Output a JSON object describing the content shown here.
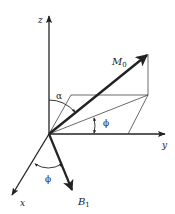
{
  "diagram": {
    "title": "",
    "axes": {
      "z_label": "z",
      "y_label": "y",
      "x_label": "x"
    },
    "vectors": {
      "magnetization_label": "M",
      "magnetization_subscript": "0",
      "field_label": "B",
      "field_subscript": "1"
    },
    "angles": {
      "alpha_label": "α",
      "phi_upper_label": "ϕ",
      "phi_lower_label": "ϕ"
    },
    "colors": {
      "line": "#222222",
      "thin_line": "#555555",
      "background": "#ffffff"
    }
  }
}
